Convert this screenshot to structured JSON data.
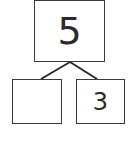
{
  "number_bond": {
    "whole": "5",
    "part_left": "",
    "part_right": "3"
  }
}
